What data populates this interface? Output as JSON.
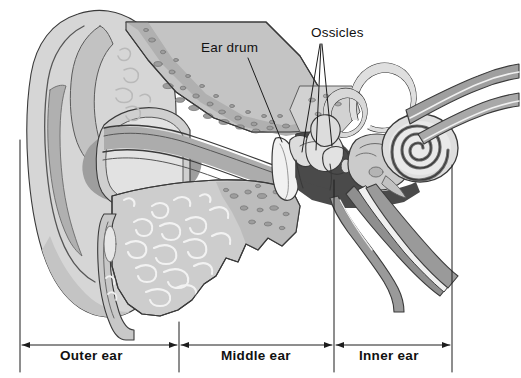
{
  "figure": {
    "type": "anatomical-diagram",
    "background_color": "#ffffff",
    "line_color": "#3a3a3a"
  },
  "callout_labels": [
    {
      "id": "eardrum",
      "text": "Ear drum",
      "leader_lines": 1
    },
    {
      "id": "ossicles",
      "text": "Ossicles",
      "leader_lines": 3
    }
  ],
  "labels": {
    "ear_drum": "Ear drum",
    "ossicles": "Ossicles"
  },
  "sections": {
    "outer": "Outer ear",
    "middle": "Middle ear",
    "inner": "Inner ear"
  },
  "palette": {
    "white": "#ffffff",
    "lightest": "#e8e8e8",
    "light": "#dcdcdc",
    "pinna_fill": "#d6d6d6",
    "mid_light": "#c9c9c9",
    "mid": "#b6b6b6",
    "canal": "#acacac",
    "concha_shadow": "#9a9a9a",
    "bone_speckle": "#8e8e8e",
    "dark": "#6f6f6f",
    "cavity_dark": "#4a4a4a",
    "outline": "#3a3a3a",
    "text": "#111111"
  },
  "anatomy_parts": [
    "pinna",
    "helix",
    "antihelix",
    "concha",
    "ear-canal",
    "temporal-bone-upper",
    "mastoid-bone-lower",
    "ear-drum",
    "ossicles",
    "middle-ear-cavity",
    "semicircular-canals",
    "vestibule",
    "cochlea",
    "auditory-nerve",
    "eustachian-tube"
  ],
  "scale_bars": [
    {
      "section": "Outer ear",
      "x_start": 20,
      "x_end": 179
    },
    {
      "section": "Middle ear",
      "x_start": 179,
      "x_end": 334
    },
    {
      "section": "Inner ear",
      "x_start": 334,
      "x_end": 452
    }
  ]
}
